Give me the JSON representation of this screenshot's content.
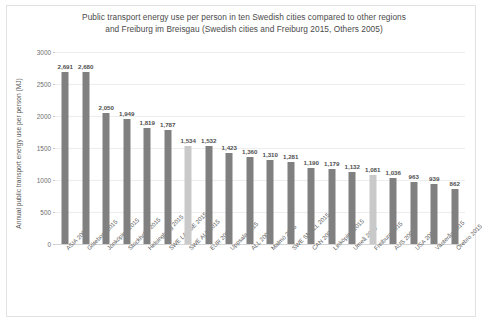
{
  "chart_data": {
    "type": "bar",
    "title": "Public transport energy use per person in ten Swedish cities compared to other regions and Freiburg im Breisgau (Swedish cities and Freiburg 2015, Others 2005)",
    "title_lines": [
      "Public transport energy use per person in ten Swedish cities compared to other regions",
      "and Freiburg im Breisgau (Swedish cities and Freiburg 2015, Others 2005)"
    ],
    "xlabel": "",
    "ylabel": "Annual public transport energy use per person (MJ)",
    "ylim": [
      0,
      3000
    ],
    "yticks": [
      0,
      500,
      1000,
      1500,
      2000,
      2500,
      3000
    ],
    "ytick_labels": [
      "0",
      "500",
      "1000",
      "1500",
      "2000",
      "2500",
      "3000"
    ],
    "grid": true,
    "legend": "none",
    "bar_color": "#808080",
    "highlight_color": "#c9c9c9",
    "categories": [
      "ASIA 2005",
      "Göteborg 2015",
      "Jönköping 2015",
      "Stockholm 2015",
      "Helsingborg 2015",
      "SWE LARGE 2015",
      "SWE ALL 2015",
      "EUR 2005",
      "Uppsala 2015",
      "ALL 2005",
      "Malmö 2015",
      "SWE SMALL 2015",
      "CAN 2005",
      "Linköping 2015",
      "Umeå 2015",
      "Freiburg 2015",
      "AUS 2006",
      "USA 2005",
      "Västerås 2015",
      "Örebro 2015"
    ],
    "values": [
      2691,
      2680,
      2050,
      1949,
      1819,
      1787,
      1534,
      1532,
      1423,
      1360,
      1310,
      1281,
      1190,
      1179,
      1132,
      1081,
      1036,
      963,
      939,
      862
    ],
    "value_labels": [
      "2,691",
      "2,680",
      "2,050",
      "1,949",
      "1,819",
      "1,787",
      "1,534",
      "1,532",
      "1,423",
      "1,360",
      "1,310",
      "1,281",
      "1,190",
      "1,179",
      "1,132",
      "1,081",
      "1,036",
      "963",
      "939",
      "862"
    ],
    "highlighted": [
      false,
      false,
      false,
      false,
      false,
      false,
      true,
      false,
      false,
      false,
      false,
      false,
      false,
      false,
      false,
      true,
      false,
      false,
      false,
      false
    ]
  }
}
